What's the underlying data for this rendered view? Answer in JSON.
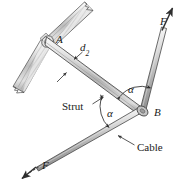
{
  "figure": {
    "kind": "engineering-mechanics-free-body-diagram",
    "background_color": "#ffffff",
    "line_color": "#3a3a3a",
    "member_fill_light": "#f2f2f2",
    "member_fill_mid": "#c9c9c9",
    "member_fill_dark": "#8e8e8e",
    "wall_hatch_color": "#9a9a9a",
    "labels": {
      "joint_a": "A",
      "joint_b": "B",
      "distance_d2": "d",
      "distance_d2_subscript": "2",
      "force_top": "F",
      "force_bottom": "F",
      "angle_upper": "α",
      "angle_lower": "α",
      "strut": "Strut",
      "cable": "Cable"
    }
  }
}
